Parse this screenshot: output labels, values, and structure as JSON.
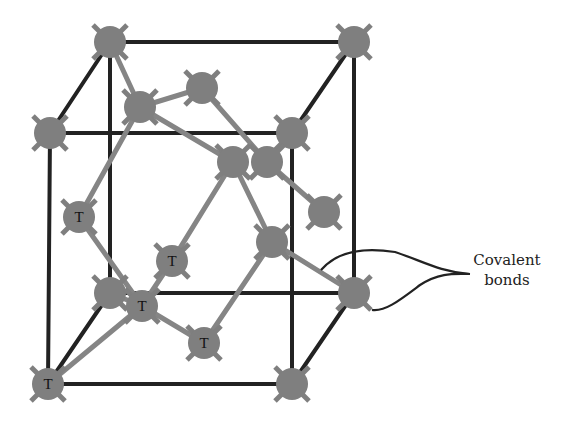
{
  "diagram": {
    "title": "",
    "type": "crystal-lattice",
    "colors": {
      "cube_edge": "#222222",
      "bond": "#808080",
      "atom": "#7f7f7f",
      "label": "#222222"
    },
    "annotation": {
      "line1": "Covalent",
      "line2": "bonds"
    },
    "atom_tag": "T",
    "atoms": [
      {
        "id": "back-tl",
        "x": 110,
        "y": 42,
        "label": ""
      },
      {
        "id": "back-tr",
        "x": 354,
        "y": 42,
        "label": ""
      },
      {
        "id": "back-bl",
        "x": 110,
        "y": 293,
        "label": ""
      },
      {
        "id": "back-br",
        "x": 354,
        "y": 293,
        "label": ""
      },
      {
        "id": "front-tl",
        "x": 50,
        "y": 133,
        "label": ""
      },
      {
        "id": "front-tr",
        "x": 292,
        "y": 133,
        "label": ""
      },
      {
        "id": "front-bl",
        "x": 48,
        "y": 384,
        "label": "T"
      },
      {
        "id": "front-br",
        "x": 292,
        "y": 384,
        "label": ""
      },
      {
        "id": "top-face-a",
        "x": 140,
        "y": 107,
        "label": ""
      },
      {
        "id": "top-face-b",
        "x": 202,
        "y": 88,
        "label": ""
      },
      {
        "id": "center-a",
        "x": 233,
        "y": 162,
        "label": ""
      },
      {
        "id": "center-b",
        "x": 267,
        "y": 162,
        "label": ""
      },
      {
        "id": "right-face",
        "x": 324,
        "y": 212,
        "label": ""
      },
      {
        "id": "inner-c",
        "x": 272,
        "y": 242,
        "label": ""
      },
      {
        "id": "left-face",
        "x": 79,
        "y": 217,
        "label": "T"
      },
      {
        "id": "inner-t1",
        "x": 172,
        "y": 261,
        "label": "T"
      },
      {
        "id": "inner-t2",
        "x": 142,
        "y": 306,
        "label": "T"
      },
      {
        "id": "inner-t3",
        "x": 204,
        "y": 343,
        "label": "T"
      }
    ]
  }
}
